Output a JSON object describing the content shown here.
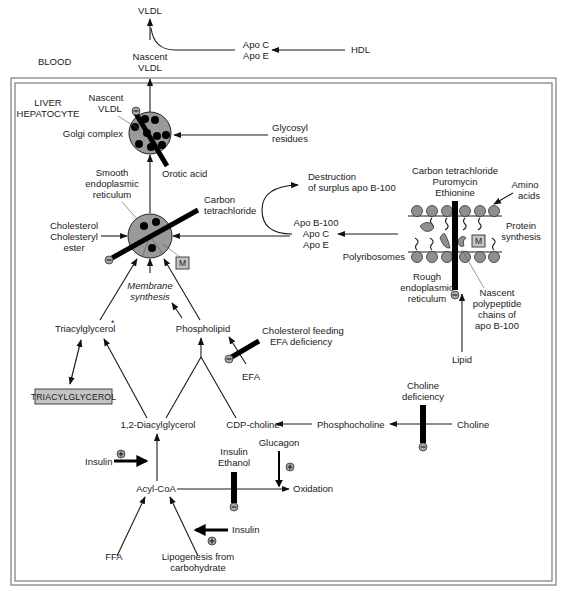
{
  "regions": {
    "blood": "BLOOD",
    "liver_line1": "LIVER",
    "liver_line2": "HEPATOCYTE"
  },
  "blood": {
    "vldl": "VLDL",
    "nascent_vldl_line1": "Nascent",
    "nascent_vldl_line2": "VLDL",
    "apo_c": "Apo C",
    "apo_e": "Apo E",
    "hdl": "HDL"
  },
  "golgi": {
    "nascent_line1": "Nascent",
    "nascent_line2": "VLDL",
    "label": "Golgi complex",
    "glycosyl_line1": "Glycosyl",
    "glycosyl_line2": "residues",
    "orotic_acid": "Orotic acid"
  },
  "smooth_er": {
    "label_line1": "Smooth",
    "label_line2": "endoplasmic",
    "label_line3": "reticulum",
    "carbon_line1": "Carbon",
    "carbon_line2": "tetrachloride",
    "chol_line1": "Cholesterol",
    "chol_line2": "Cholesteryl",
    "chol_line3": "ester",
    "m_box": "M",
    "membrane_line1": "Membrane",
    "membrane_line2": "synthesis"
  },
  "apo_transfer": {
    "destruction_line1": "Destruction",
    "destruction_line2": "of surplus apo B-100",
    "apo_b100": "Apo B-100",
    "apo_c": "Apo C",
    "apo_e": "Apo E"
  },
  "rough_er": {
    "inhibitors_line1": "Carbon tetrachloride",
    "inhibitors_line2": "Puromycin",
    "inhibitors_line3": "Ethionine",
    "amino_line1": "Amino",
    "amino_line2": "acids",
    "protein_line1": "Protein",
    "protein_line2": "synthesis",
    "polyribosomes": "Polyribosomes",
    "m_box": "M",
    "label_line1": "Rough",
    "label_line2": "endoplasmic",
    "label_line3": "reticulum",
    "nascent_line1": "Nascent",
    "nascent_line2": "polypeptide",
    "nascent_line3": "chains of",
    "nascent_line4": "apo B-100",
    "lipid": "Lipid"
  },
  "lipid_synthesis": {
    "triacylglycerol": "Triacylglycerol",
    "asterisk": "*",
    "phospholipid": "Phospholipid",
    "tg_store": "TRIACYLGLYCEROL",
    "chol_feeding": "Cholesterol feeding",
    "efa_deficiency": "EFA deficiency",
    "efa": "EFA",
    "diacylglycerol": "1,2-Diacylglycerol",
    "cdp_choline": "CDP-choline",
    "phosphocholine": "Phosphocholine",
    "choline_def_line1": "Choline",
    "choline_def_line2": "deficiency",
    "choline": "Choline"
  },
  "fatty_acid": {
    "insulin_stim": "Insulin",
    "acyl_coa": "Acyl-CoA",
    "insulin_inhib": "Insulin",
    "ethanol": "Ethanol",
    "glucagon": "Glucagon",
    "oxidation": "Oxidation",
    "ffa": "FFA",
    "lipogenesis_line1": "Lipogenesis from",
    "lipogenesis_line2": "carbohydrate",
    "insulin_lipogenesis": "Insulin"
  },
  "signs": {
    "plus": "+",
    "minus": "−"
  }
}
